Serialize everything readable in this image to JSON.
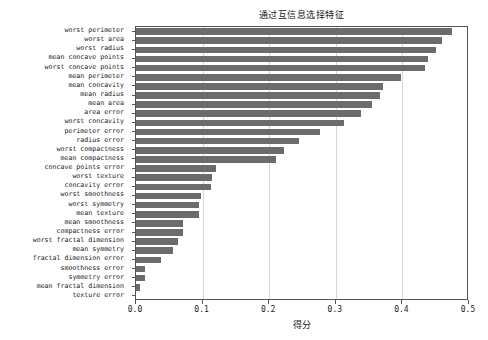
{
  "chart_data": {
    "type": "bar",
    "orientation": "horizontal",
    "title": "通过互信息选择特征",
    "xlabel": "得分",
    "ylabel": "",
    "xlim": [
      0.0,
      0.5
    ],
    "xticks": [
      "0.0",
      "0.1",
      "0.2",
      "0.3",
      "0.4",
      "0.5"
    ],
    "xtick_values": [
      0.0,
      0.1,
      0.2,
      0.3,
      0.4,
      0.5
    ],
    "grid": "vertical",
    "legend": "none",
    "bar_color": "#6b6b6b",
    "categories": [
      "worst perimeter",
      "worst area",
      "worst radius",
      "mean concave points",
      "worst concave points",
      "mean perimeter",
      "mean concavity",
      "mean radius",
      "mean area",
      "area error",
      "worst concavity",
      "perimeter error",
      "radius error",
      "worst compactness",
      "mean compactness",
      "concave points error",
      "worst texture",
      "concavity error",
      "worst smoothness",
      "worst symmetry",
      "mean texture",
      "mean smoothness",
      "compactness error",
      "worst fractal dimension",
      "mean symmetry",
      "fractal dimension error",
      "smoothness error",
      "symmetry error",
      "mean fractal dimension",
      "texture error"
    ],
    "values": [
      0.474,
      0.459,
      0.45,
      0.439,
      0.434,
      0.398,
      0.371,
      0.366,
      0.355,
      0.338,
      0.313,
      0.276,
      0.245,
      0.222,
      0.21,
      0.12,
      0.114,
      0.112,
      0.098,
      0.095,
      0.094,
      0.071,
      0.071,
      0.063,
      0.056,
      0.038,
      0.014,
      0.013,
      0.006,
      0.0
    ]
  }
}
